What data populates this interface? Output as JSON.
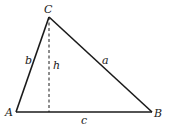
{
  "diagram": {
    "vertices": {
      "A": {
        "label": "A",
        "x": 16,
        "y": 112
      },
      "B": {
        "label": "B",
        "x": 152,
        "y": 112
      },
      "C": {
        "label": "C",
        "x": 49,
        "y": 17
      }
    },
    "sides": {
      "a": {
        "label": "a",
        "from": "B",
        "to": "C"
      },
      "b": {
        "label": "b",
        "from": "A",
        "to": "C"
      },
      "c": {
        "label": "c",
        "from": "A",
        "to": "B"
      }
    },
    "altitude": {
      "label": "h",
      "from": "C",
      "foot_x": 49,
      "foot_y": 112,
      "style": "dashed"
    },
    "colors": {
      "stroke": "#1a1a1a",
      "background": "#ffffff"
    }
  }
}
